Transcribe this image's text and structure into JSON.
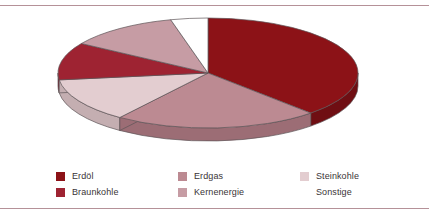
{
  "figure": {
    "background_color": "#ffffff",
    "rule_color": "#b59198"
  },
  "chart_data": {
    "type": "pie",
    "title": "",
    "subtitle": "",
    "xlabel": "",
    "ylabel": "",
    "three_d": true,
    "start_angle_deg": 0,
    "direction": "clockwise",
    "legend_position": "bottom",
    "grid": false,
    "categories": [
      "Erdöl",
      "Erdgas",
      "Steinkohle",
      "Braunkohle",
      "Kernenergie",
      "Sonstige"
    ],
    "values": [
      38,
      22,
      13,
      11,
      12,
      4
    ],
    "colors": [
      "#8c1217",
      "#bc8a92",
      "#e3cdd0",
      "#9e2332",
      "#c69ca4",
      "#ffffff"
    ],
    "side_colors": [
      "#6f0e13",
      "#9c6d75",
      "#c4aeb1",
      "#7d1a26",
      "#a87d85",
      "#dedede"
    ],
    "slices": [
      {
        "label": "Erdöl",
        "value": 38,
        "color": "#8c1217",
        "side_color": "#6f0e13"
      },
      {
        "label": "Erdgas",
        "value": 22,
        "color": "#bc8a92",
        "side_color": "#9c6d75"
      },
      {
        "label": "Steinkohle",
        "value": 13,
        "color": "#e3cdd0",
        "side_color": "#c4aeb1"
      },
      {
        "label": "Braunkohle",
        "value": 11,
        "color": "#9e2332",
        "side_color": "#7d1a26"
      },
      {
        "label": "Kernenergie",
        "value": 12,
        "color": "#c69ca4",
        "side_color": "#a87d85"
      },
      {
        "label": "Sonstige",
        "value": 4,
        "color": "#ffffff",
        "side_color": "#dedede"
      }
    ]
  },
  "legend": {
    "items": [
      {
        "label": "Erdöl",
        "color": "#8c1217",
        "blank": false
      },
      {
        "label": "Erdgas",
        "color": "#bc8a92",
        "blank": false
      },
      {
        "label": "Steinkohle",
        "color": "#e3cdd0",
        "blank": false
      },
      {
        "label": "Braunkohle",
        "color": "#9e2332",
        "blank": false
      },
      {
        "label": "Kernenergie",
        "color": "#c69ca4",
        "blank": false
      },
      {
        "label": "Sonstige",
        "color": "#ffffff",
        "blank": true
      }
    ]
  }
}
